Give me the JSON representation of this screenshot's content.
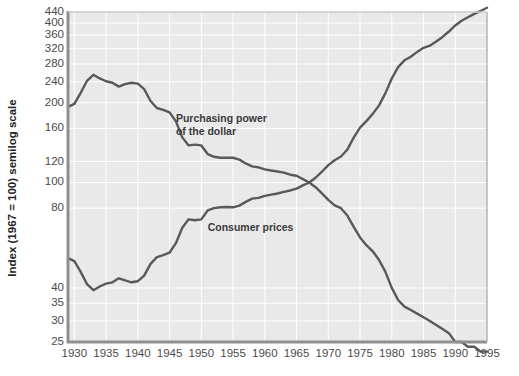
{
  "chart_data": {
    "type": "line",
    "title": "",
    "xlabel": "",
    "ylabel": "Index (1967 = 100) semilog scale",
    "scale": "semilog",
    "grid": true,
    "legend_position": "inline-annotations",
    "xlim": [
      1929,
      1995
    ],
    "ylim": [
      25,
      440
    ],
    "xticks": [
      "1930",
      "1935",
      "1940",
      "1945",
      "1950",
      "1955",
      "1960",
      "1965",
      "1970",
      "1975",
      "1980",
      "1985",
      "1990",
      "1995"
    ],
    "yticks": [
      "440",
      "400",
      "360",
      "320",
      "280",
      "240",
      "200",
      "160",
      "120",
      "100",
      "80",
      "40",
      "35",
      "30",
      "25"
    ],
    "annotations": [
      {
        "text_line1": "Purchasing power",
        "text_line2": "of the dollar",
        "x": 1946,
        "y": 175
      },
      {
        "text_line1": "Consumer prices",
        "text_line2": "",
        "x": 1951,
        "y": 68
      }
    ],
    "series": [
      {
        "name": "Purchasing power of the dollar",
        "color": "#595959",
        "x": [
          1929,
          1930,
          1931,
          1932,
          1933,
          1934,
          1935,
          1936,
          1937,
          1938,
          1939,
          1940,
          1941,
          1942,
          1943,
          1944,
          1945,
          1946,
          1947,
          1948,
          1949,
          1950,
          1951,
          1952,
          1953,
          1954,
          1955,
          1956,
          1957,
          1958,
          1959,
          1960,
          1961,
          1962,
          1963,
          1964,
          1965,
          1966,
          1967,
          1968,
          1969,
          1970,
          1971,
          1972,
          1973,
          1974,
          1975,
          1976,
          1977,
          1978,
          1979,
          1980,
          1981,
          1982,
          1983,
          1984,
          1985,
          1986,
          1987,
          1988,
          1989,
          1990,
          1991,
          1992,
          1993,
          1994,
          1995
        ],
        "y": [
          193,
          198,
          218,
          242,
          255,
          247,
          241,
          238,
          230,
          235,
          238,
          236,
          225,
          203,
          191,
          188,
          184,
          170,
          148,
          138,
          139,
          138,
          128,
          125,
          124,
          124,
          124,
          122,
          118,
          115,
          114,
          112,
          111,
          110,
          109,
          107,
          106,
          103,
          100,
          96,
          91,
          86,
          82,
          80,
          75,
          68,
          62,
          58,
          55,
          51,
          46,
          40,
          36,
          34,
          33,
          32,
          31,
          30,
          29,
          28,
          27,
          25,
          25,
          24,
          24,
          23,
          23
        ]
      },
      {
        "name": "Consumer prices",
        "color": "#595959",
        "x": [
          1929,
          1930,
          1931,
          1932,
          1933,
          1934,
          1935,
          1936,
          1937,
          1938,
          1939,
          1940,
          1941,
          1942,
          1943,
          1944,
          1945,
          1946,
          1947,
          1948,
          1949,
          1950,
          1951,
          1952,
          1953,
          1954,
          1955,
          1956,
          1957,
          1958,
          1959,
          1960,
          1961,
          1962,
          1963,
          1964,
          1965,
          1966,
          1967,
          1968,
          1969,
          1970,
          1971,
          1972,
          1973,
          1974,
          1975,
          1976,
          1977,
          1978,
          1979,
          1980,
          1981,
          1982,
          1983,
          1984,
          1985,
          1986,
          1987,
          1988,
          1989,
          1990,
          1991,
          1992,
          1993,
          1994,
          1995
        ],
        "y": [
          51.8,
          50.5,
          46.0,
          41.3,
          39.2,
          40.5,
          41.5,
          42.0,
          43.5,
          42.7,
          42.0,
          42.4,
          44.5,
          49.3,
          52.3,
          53.2,
          54.4,
          59.0,
          67.5,
          72.6,
          72.0,
          72.6,
          78.4,
          80.0,
          80.6,
          80.8,
          80.6,
          81.8,
          84.5,
          86.9,
          87.5,
          89.0,
          90.0,
          90.9,
          92.1,
          93.3,
          94.8,
          97.5,
          100.0,
          104.2,
          109.8,
          116.3,
          121.3,
          125.3,
          133.1,
          147.7,
          161.2,
          170.5,
          181.5,
          195.4,
          217.4,
          246.8,
          272.4,
          289.1,
          298.4,
          311.1,
          322.2,
          328.4,
          340.4,
          354.3,
          371.3,
          391.4,
          408.0,
          420.3,
          432.7,
          444.0,
          456.5
        ]
      }
    ]
  },
  "axis_title": {
    "y": "Index (1967 = 100) semilog scale"
  }
}
